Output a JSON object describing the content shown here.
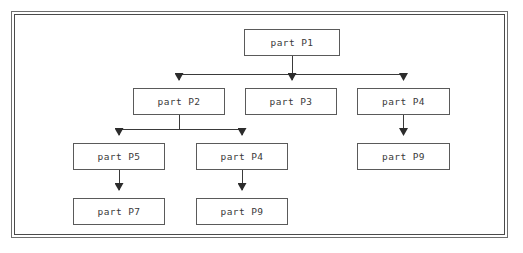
{
  "diagram": {
    "frame": {
      "style": "double-line-border",
      "border_color": "#5a5a5a",
      "background": "#ffffff"
    },
    "node_style": {
      "border_color": "#5a5a5a",
      "fill": "#ffffff",
      "text_color": "#3a3a3a"
    },
    "edge_style": {
      "line_color": "#3a3a3a",
      "arrowhead": "solid-triangle-down",
      "routing": "orthogonal-elbow"
    },
    "nodes": [
      {
        "id": "n1",
        "label": "part P1",
        "x": 244,
        "y": 29,
        "w": 96,
        "h": 27
      },
      {
        "id": "n2",
        "label": "part P2",
        "x": 133,
        "y": 88,
        "w": 92,
        "h": 27
      },
      {
        "id": "n3",
        "label": "part P3",
        "x": 245,
        "y": 88,
        "w": 92,
        "h": 27
      },
      {
        "id": "n4",
        "label": "part P4",
        "x": 357,
        "y": 88,
        "w": 93,
        "h": 27
      },
      {
        "id": "n5",
        "label": "part P5",
        "x": 73,
        "y": 143,
        "w": 92,
        "h": 27
      },
      {
        "id": "n6",
        "label": "part P4",
        "x": 196,
        "y": 143,
        "w": 92,
        "h": 27
      },
      {
        "id": "n7",
        "label": "part P9",
        "x": 357,
        "y": 143,
        "w": 93,
        "h": 27
      },
      {
        "id": "n8",
        "label": "part P7",
        "x": 73,
        "y": 198,
        "w": 92,
        "h": 27
      },
      {
        "id": "n9",
        "label": "part P9",
        "x": 196,
        "y": 198,
        "w": 92,
        "h": 27
      }
    ],
    "edges": [
      {
        "from": "n1",
        "to": "n2",
        "type": "elbow"
      },
      {
        "from": "n1",
        "to": "n3",
        "type": "straight"
      },
      {
        "from": "n1",
        "to": "n4",
        "type": "elbow"
      },
      {
        "from": "n2",
        "to": "n5",
        "type": "elbow"
      },
      {
        "from": "n2",
        "to": "n6",
        "type": "elbow"
      },
      {
        "from": "n4",
        "to": "n7",
        "type": "straight"
      },
      {
        "from": "n5",
        "to": "n8",
        "type": "straight"
      },
      {
        "from": "n6",
        "to": "n9",
        "type": "straight"
      }
    ]
  }
}
